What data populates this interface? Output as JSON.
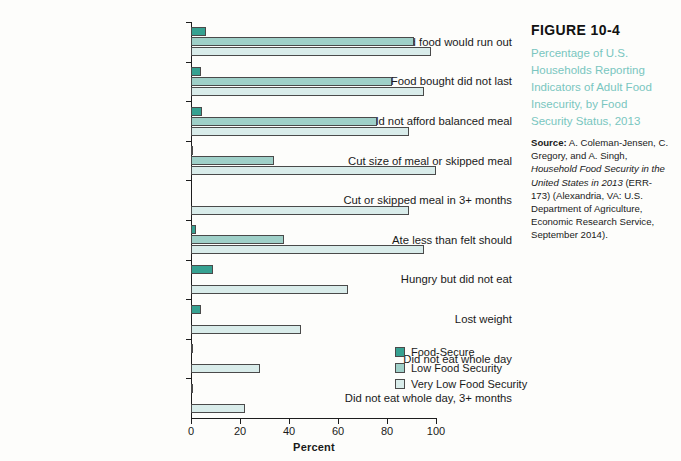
{
  "caption": {
    "figure_number": "FIGURE 10-4",
    "title": "Percentage of U.S. Households Reporting Indicators of Adult Food Insecurity, by Food Security Status, 2013",
    "source_lead": "Source:",
    "source_part1": " A. Coleman-Jensen, C. Gregory, and A. Singh, ",
    "source_italic": "Household Food Security in the United States in 2013",
    "source_part2": " (ERR-173) (Alexandria, VA: U.S. Department of Agriculture, Economic Research Service, September 2014)."
  },
  "colors": {
    "food_secure": "#36a191",
    "low_food_security": "#9fd0c8",
    "very_low_food_security": "#d9ecea",
    "title_teal": "#79c6c0",
    "axis": "#1d1d1d"
  },
  "chart_data": {
    "type": "bar",
    "orientation": "horizontal",
    "title": "Percentage of U.S. Households Reporting Indicators of Adult Food Insecurity, by Food Security Status, 2013",
    "xlabel": "Percent",
    "ylabel": "",
    "xlim": [
      0,
      100
    ],
    "xticks": [
      0,
      20,
      40,
      60,
      80,
      100
    ],
    "xticklabels": [
      "0",
      "20",
      "40",
      "60",
      "80",
      "100"
    ],
    "grid": false,
    "legend_position": "inside-right",
    "categories": [
      "Worried food would run out",
      "Food bought did not last",
      "Could not afford balanced meal",
      "Cut size of meal or skipped meal",
      "Cut or skipped meal in 3+ months",
      "Ate less than felt should",
      "Hungry but did not eat",
      "Lost weight",
      "Did not eat whole day",
      "Did not eat whole day, 3+ months"
    ],
    "series": [
      {
        "name": "Food-Secure",
        "color": "#36a191",
        "values": [
          6,
          4,
          4.5,
          1,
          0,
          2,
          9,
          4,
          1,
          0.6
        ]
      },
      {
        "name": "Low Food Security",
        "color": "#9fd0c8",
        "values": [
          91,
          82,
          76,
          34,
          0,
          38,
          0,
          0,
          0,
          0
        ]
      },
      {
        "name": "Very Low Food Security",
        "color": "#d9ecea",
        "values": [
          98,
          95,
          89,
          100,
          89,
          95,
          64,
          45,
          28,
          22
        ]
      }
    ]
  }
}
